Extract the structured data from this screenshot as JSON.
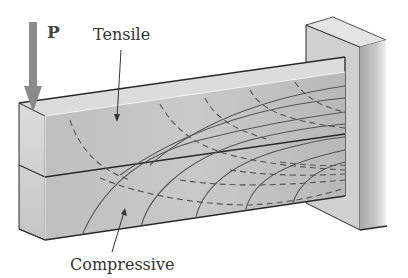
{
  "figure": {
    "load_label": "P",
    "tensile_label": "Tensile",
    "compressive_label": "Compressive"
  },
  "colors": {
    "beam_front": "#c4c4c4",
    "beam_top": "#dedede",
    "beam_end": "#d2d2d2",
    "wall_front": "#bdbdbd",
    "wall_side": "#d6d6d6",
    "arrow": "#8a8a8a",
    "line": "#2a2a2a"
  }
}
